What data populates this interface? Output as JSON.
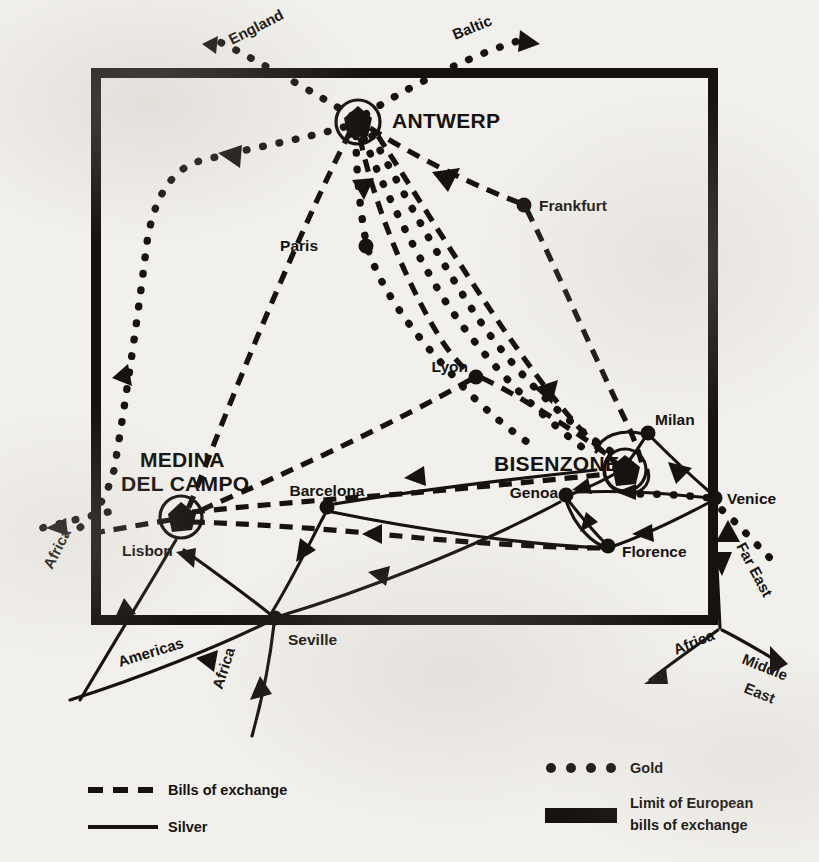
{
  "figure": {
    "kind": "historical-trade-route-map",
    "region": "Europe",
    "background_color": "#f2f0ec",
    "ink_color": "#15120f"
  },
  "fairs": [
    {
      "id": "antwerp",
      "label": "ANTWERP",
      "x": 358,
      "y": 122,
      "label_x": 392,
      "label_y": 128,
      "ring": true
    },
    {
      "id": "medina",
      "label": "MEDINA",
      "x": 181,
      "y": 517,
      "label_x": 140,
      "label_y": 467,
      "ring": true
    },
    {
      "id": "medina2",
      "label": "DEL CAMPO",
      "x": 181,
      "y": 517,
      "label_x": 121,
      "label_y": 491,
      "ring": false
    },
    {
      "id": "bisenzone",
      "label": "BISENZONE",
      "x": 625,
      "y": 470,
      "label_x": 494,
      "label_y": 471,
      "ring": true
    }
  ],
  "cities": [
    {
      "id": "paris",
      "label": "Paris",
      "x": 366,
      "y": 246,
      "label_x": 318,
      "label_y": 251,
      "anchor": "end"
    },
    {
      "id": "frankfurt",
      "label": "Frankfurt",
      "x": 524,
      "y": 205,
      "label_x": 539,
      "label_y": 211,
      "anchor": "start"
    },
    {
      "id": "lyon",
      "label": "Lyon",
      "x": 476,
      "y": 377,
      "label_x": 468,
      "label_y": 372,
      "anchor": "end"
    },
    {
      "id": "milan",
      "label": "Milan",
      "x": 648,
      "y": 433,
      "label_x": 655,
      "label_y": 425,
      "anchor": "start"
    },
    {
      "id": "venice",
      "label": "Venice",
      "x": 715,
      "y": 498,
      "label_x": 727,
      "label_y": 504,
      "anchor": "start"
    },
    {
      "id": "genoa",
      "label": "Genoa",
      "x": 566,
      "y": 495,
      "label_x": 558,
      "label_y": 498,
      "anchor": "end"
    },
    {
      "id": "florence",
      "label": "Florence",
      "x": 608,
      "y": 546,
      "label_x": 622,
      "label_y": 557,
      "anchor": "start"
    },
    {
      "id": "barcelona",
      "label": "Barcelona",
      "x": 327,
      "y": 507,
      "label_x": 327,
      "label_y": 496,
      "anchor": "middle"
    },
    {
      "id": "lisbon",
      "label": "Lisbon",
      "x": 181,
      "y": 527,
      "label_x": 122,
      "label_y": 556,
      "anchor": "start"
    },
    {
      "id": "seville",
      "label": "Seville",
      "x": 275,
      "y": 618,
      "label_x": 288,
      "label_y": 645,
      "anchor": "start"
    }
  ],
  "external_routes": [
    {
      "id": "england",
      "label": "England",
      "label_x": 232,
      "label_y": 45,
      "rotate": -27
    },
    {
      "id": "baltic",
      "label": "Baltic",
      "label_x": 455,
      "label_y": 40,
      "rotate": -22
    },
    {
      "id": "africa_nw",
      "label": "Africa",
      "label_x": 52,
      "label_y": 570,
      "rotate": -63
    },
    {
      "id": "americas",
      "label": "Americas",
      "label_x": 120,
      "label_y": 667,
      "rotate": -17
    },
    {
      "id": "africa_s",
      "label": "Africa",
      "label_x": 222,
      "label_y": 690,
      "rotate": -72
    },
    {
      "id": "far_east",
      "label": "Far East",
      "label_x": 736,
      "label_y": 546,
      "rotate": 62
    },
    {
      "id": "africa_se",
      "label": "Africa",
      "label_x": 676,
      "label_y": 655,
      "rotate": -22
    },
    {
      "id": "middle_east",
      "label": "Middle",
      "label_x": 741,
      "label_y": 663,
      "rotate": 22
    },
    {
      "id": "middle_east2",
      "label": "East",
      "label_x": 743,
      "label_y": 692,
      "rotate": 22
    }
  ],
  "legend": {
    "left": [
      {
        "id": "bills",
        "label": "Bills of exchange",
        "style": "dashed"
      },
      {
        "id": "silver",
        "label": "Silver",
        "style": "solid"
      }
    ],
    "right": [
      {
        "id": "gold",
        "label": "Gold",
        "style": "dotted"
      },
      {
        "id": "limit",
        "label_line1": "Limit of European",
        "label_line2": "bills of exchange",
        "style": "thick-bar"
      }
    ]
  },
  "limit_box": {
    "x": 96,
    "y": 73,
    "width": 617,
    "height": 547
  }
}
